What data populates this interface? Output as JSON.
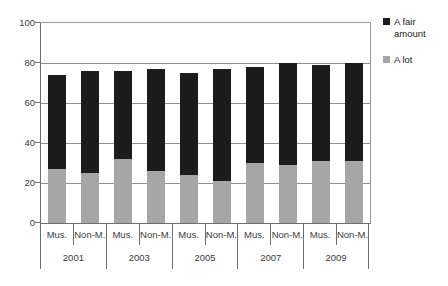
{
  "chart_data": {
    "type": "bar",
    "stacked": true,
    "title": "",
    "xlabel": "",
    "ylabel": "",
    "ylim": [
      0,
      100
    ],
    "yticks": [
      0,
      20,
      40,
      60,
      80,
      100
    ],
    "grid": true,
    "legend_position": "right",
    "categories": [
      "Mus.",
      "Non-M.",
      "Mus.",
      "Non-M.",
      "Mus.",
      "Non-M.",
      "Mus.",
      "Non-M.",
      "Mus.",
      "Non-M."
    ],
    "groups": [
      {
        "year": "2001",
        "categories": [
          "Mus.",
          "Non-M."
        ]
      },
      {
        "year": "2003",
        "categories": [
          "Mus.",
          "Non-M."
        ]
      },
      {
        "year": "2005",
        "categories": [
          "Mus.",
          "Non-M."
        ]
      },
      {
        "year": "2007",
        "categories": [
          "Mus.",
          "Non-M."
        ]
      },
      {
        "year": "2009",
        "categories": [
          "Mus.",
          "Non-M."
        ]
      }
    ],
    "series": [
      {
        "name": "A lot",
        "color": "#a6a6a6",
        "values": [
          27,
          25,
          32,
          26,
          24,
          21,
          30,
          29,
          31,
          31
        ]
      },
      {
        "name": "A fair amount",
        "color": "#1c1c1c",
        "values": [
          47,
          51,
          44,
          51,
          51,
          56,
          48,
          51,
          48,
          49
        ]
      }
    ],
    "totals": [
      74,
      76,
      76,
      77,
      75,
      77,
      78,
      80,
      79,
      80
    ]
  },
  "legend": {
    "entries": [
      {
        "label": "A fair amount",
        "color": "#1c1c1c"
      },
      {
        "label": "A lot",
        "color": "#a6a6a6"
      }
    ]
  },
  "axis": {
    "y_tick_labels": [
      "100",
      "80",
      "60",
      "40",
      "20",
      "0"
    ]
  }
}
